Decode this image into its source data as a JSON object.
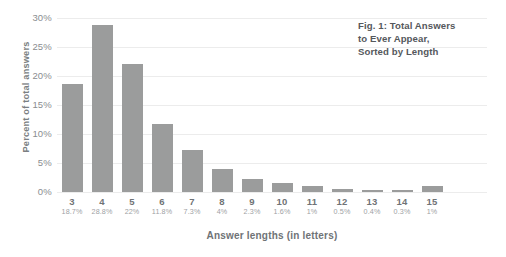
{
  "chart_data": {
    "type": "bar",
    "title_lines": [
      "Fig. 1: Total Answers",
      "to Ever Appear,",
      "Sorted by Length"
    ],
    "xlabel": "Answer lengths (in letters)",
    "ylabel": "Percent of total answers",
    "categories": [
      "3",
      "4",
      "5",
      "6",
      "7",
      "8",
      "9",
      "10",
      "11",
      "12",
      "13",
      "14",
      "15"
    ],
    "values": [
      18.7,
      28.8,
      22,
      11.8,
      7.3,
      4,
      2.3,
      1.6,
      1,
      0.5,
      0.4,
      0.3,
      1
    ],
    "value_labels": [
      "18.7%",
      "28.8%",
      "22%",
      "11.8%",
      "7.3%",
      "4%",
      "2.3%",
      "1.6%",
      "1%",
      "0.5%",
      "0.4%",
      "0.3%",
      "1%"
    ],
    "ylim": [
      0,
      30
    ],
    "yticks": [
      0,
      5,
      10,
      15,
      20,
      25,
      30
    ],
    "ytick_labels": [
      "0%",
      "5%",
      "10%",
      "15%",
      "20%",
      "25%",
      "30%"
    ],
    "grid": true,
    "legend": "none",
    "bar_color": "#9b9c9c",
    "gridline_color": "#ececec",
    "text_color": "#6f7376",
    "title_color": "#55585c",
    "background": "#ffffff"
  }
}
